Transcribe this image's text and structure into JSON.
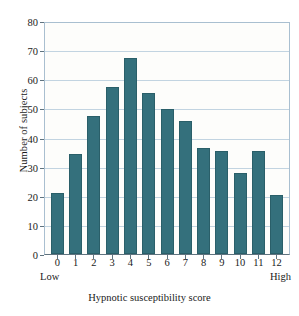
{
  "chart_data": {
    "type": "bar",
    "title": "",
    "xlabel": "Hypnotic susceptibility score",
    "ylabel": "Number of subjects",
    "categories": [
      "0",
      "1",
      "2",
      "3",
      "4",
      "5",
      "6",
      "7",
      "8",
      "9",
      "10",
      "11",
      "12"
    ],
    "values": [
      21,
      34.5,
      47.5,
      57.5,
      67.5,
      55.5,
      50,
      46,
      36.5,
      35.5,
      28,
      35.5,
      20.5
    ],
    "ylim": [
      0,
      80
    ],
    "yticks": [
      0,
      10,
      20,
      30,
      40,
      50,
      60,
      70,
      80
    ],
    "ytick_labels": [
      "0",
      "10",
      "20",
      "30",
      "40",
      "50",
      "60",
      "70",
      "80"
    ],
    "grid": "horizontal",
    "legend": "none",
    "annotations": {
      "low_anchor": "Low",
      "high_anchor": "High"
    },
    "colors": {
      "bar": "#34707c",
      "bar_edge": "#2a5f69",
      "gridline": "#c2d4e1",
      "frame": "#a9bfd0",
      "axis": "#5f737f",
      "plot_background": "#fdfdfb",
      "text": "#1a1a1a"
    }
  }
}
